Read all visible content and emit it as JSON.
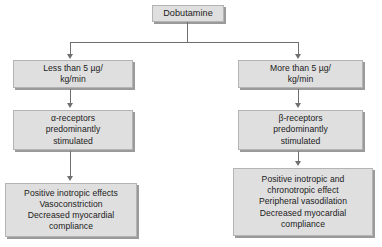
{
  "diagram": {
    "colors": {
      "box_fill": "#dfdfdf",
      "box_border": "#b4b4b4",
      "box_shadow": "#9a9a9a",
      "connector": "#6f6f6f",
      "text": "#1b1b1b",
      "background": "#ffffff"
    },
    "nodes": {
      "root": "Dobutamine",
      "left_dose": "Less than 5 µg/\nkg/min",
      "right_dose": "More than 5 µg/\nkg/min",
      "left_receptor": "α-receptors\npredominantly\nstimulated",
      "right_receptor": "β-receptors\npredominantly\nstimulated",
      "left_effects": "Positive inotropic effects\nVasoconstriction\nDecreased myocardial\ncompliance",
      "right_effects": "Positive inotropic and\nchronotropic effect\nPeripheral vasodilation\nDecreased myocardial\ncompliance"
    }
  }
}
